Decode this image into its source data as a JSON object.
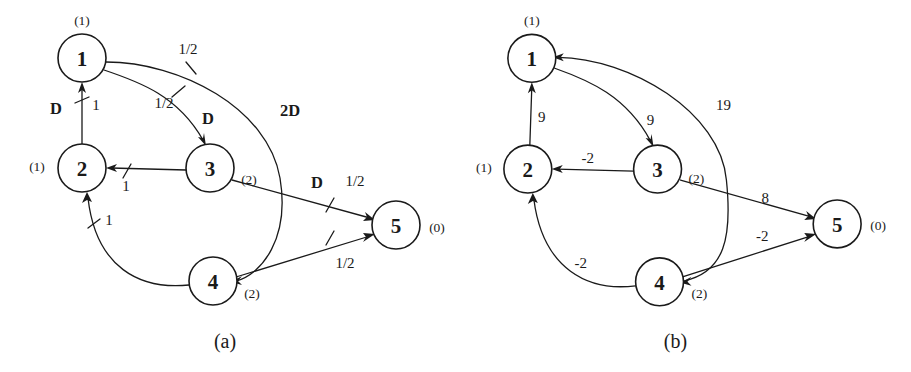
{
  "figure": {
    "background": "#ffffff",
    "ink": "#1a1a1a",
    "panels": [
      {
        "id": "a",
        "caption": "(a)",
        "nodes": [
          {
            "id": "1",
            "label": "1",
            "annotation": "(1)",
            "cx": 82,
            "cy": 58,
            "r": 24,
            "annot_x": 82,
            "annot_y": 20
          },
          {
            "id": "2",
            "label": "2",
            "annotation": "(1)",
            "cx": 82,
            "cy": 168,
            "r": 24,
            "annot_x": 37,
            "annot_y": 166
          },
          {
            "id": "3",
            "label": "3",
            "annotation": "(2)",
            "cx": 210,
            "cy": 168,
            "r": 24,
            "annot_x": 249,
            "annot_y": 179
          },
          {
            "id": "4",
            "label": "4",
            "annotation": "(2)",
            "cx": 213,
            "cy": 281,
            "r": 24,
            "annot_x": 252,
            "annot_y": 293
          },
          {
            "id": "5",
            "label": "5",
            "annotation": "(0)",
            "cx": 396,
            "cy": 225,
            "r": 24,
            "annot_x": 437,
            "annot_y": 227
          }
        ],
        "edges": [
          {
            "id": "e2-1",
            "from": "2",
            "to": "1",
            "labels": [
              "D",
              "1"
            ]
          },
          {
            "id": "e1-3",
            "from": "1",
            "to": "3",
            "labels": [
              "1/2",
              "D"
            ]
          },
          {
            "id": "e3-2",
            "from": "3",
            "to": "2",
            "labels": [
              "1"
            ]
          },
          {
            "id": "e1-4",
            "from": "1",
            "to": "4",
            "labels": [
              "1/2",
              "2D"
            ]
          },
          {
            "id": "e3-5",
            "from": "3",
            "to": "5",
            "labels": [
              "D",
              "1/2"
            ]
          },
          {
            "id": "e4-5",
            "from": "4",
            "to": "5",
            "labels": [
              "1/2"
            ]
          },
          {
            "id": "e4-2",
            "from": "4",
            "to": "2",
            "labels": [
              "1"
            ]
          }
        ],
        "edge_labels": [
          {
            "id": "a-lbl-D-21",
            "text": "D",
            "x": 56,
            "y": 108,
            "bold": true
          },
          {
            "id": "a-lbl-1-21",
            "text": "1",
            "x": 96,
            "y": 105,
            "bold": false
          },
          {
            "id": "a-lbl-half-13",
            "text": "1/2",
            "x": 164,
            "y": 103,
            "bold": false
          },
          {
            "id": "a-lbl-D-13",
            "text": "D",
            "x": 208,
            "y": 118,
            "bold": true
          },
          {
            "id": "a-lbl-half-14",
            "text": "1/2",
            "x": 188,
            "y": 49,
            "bold": false
          },
          {
            "id": "a-lbl-2D-14",
            "text": "2D",
            "x": 290,
            "y": 110,
            "bold": true
          },
          {
            "id": "a-lbl-1-32",
            "text": "1",
            "x": 126,
            "y": 186,
            "bold": false
          },
          {
            "id": "a-lbl-D-35",
            "text": "D",
            "x": 317,
            "y": 182,
            "bold": true
          },
          {
            "id": "a-lbl-half-35",
            "text": "1/2",
            "x": 355,
            "y": 181,
            "bold": false
          },
          {
            "id": "a-lbl-half-45",
            "text": "1/2",
            "x": 345,
            "y": 263,
            "bold": false
          },
          {
            "id": "a-lbl-1-42",
            "text": "1",
            "x": 109,
            "y": 220,
            "bold": false
          }
        ]
      },
      {
        "id": "b",
        "caption": "(b)",
        "nodes": [
          {
            "id": "1",
            "label": "1",
            "annotation": "(1)",
            "cx": 77,
            "cy": 58,
            "r": 24,
            "annot_x": 77,
            "annot_y": 20
          },
          {
            "id": "2",
            "label": "2",
            "annotation": "(1)",
            "cx": 73,
            "cy": 169,
            "r": 24,
            "annot_x": 29,
            "annot_y": 167
          },
          {
            "id": "3",
            "label": "3",
            "annotation": "(2)",
            "cx": 203,
            "cy": 169,
            "r": 24,
            "annot_x": 242,
            "annot_y": 178
          },
          {
            "id": "4",
            "label": "4",
            "annotation": "(2)",
            "cx": 205,
            "cy": 282,
            "r": 24,
            "annot_x": 245,
            "annot_y": 294
          },
          {
            "id": "5",
            "label": "5",
            "annotation": "(0)",
            "cx": 383,
            "cy": 224,
            "r": 24,
            "annot_x": 424,
            "annot_y": 226
          }
        ],
        "edges": [
          {
            "id": "e2-1",
            "from": "2",
            "to": "1",
            "labels": [
              "9"
            ]
          },
          {
            "id": "e1-3",
            "from": "1",
            "to": "3",
            "labels": [
              "9"
            ]
          },
          {
            "id": "e3-2",
            "from": "3",
            "to": "2",
            "labels": [
              "-2"
            ]
          },
          {
            "id": "e1-4",
            "from": "1",
            "to": "4",
            "labels": [
              "19"
            ]
          },
          {
            "id": "e3-5",
            "from": "3",
            "to": "5",
            "labels": [
              "8"
            ]
          },
          {
            "id": "e4-5",
            "from": "4",
            "to": "5",
            "labels": [
              "-2"
            ]
          },
          {
            "id": "e4-2",
            "from": "4",
            "to": "2",
            "labels": [
              "-2"
            ]
          }
        ],
        "edge_labels": [
          {
            "id": "b-lbl-9-21",
            "text": "9",
            "x": 87,
            "y": 117,
            "bold": false
          },
          {
            "id": "b-lbl-9-13",
            "text": "9",
            "x": 196,
            "y": 120,
            "bold": false
          },
          {
            "id": "b-lbl-19-14",
            "text": "19",
            "x": 269,
            "y": 105,
            "bold": false
          },
          {
            "id": "b-lbl-n2-32",
            "text": "-2",
            "x": 133,
            "y": 158,
            "bold": false
          },
          {
            "id": "b-lbl-8-35",
            "text": "8",
            "x": 311,
            "y": 198,
            "bold": false
          },
          {
            "id": "b-lbl-n2-45",
            "text": "-2",
            "x": 308,
            "y": 236,
            "bold": false
          },
          {
            "id": "b-lbl-n2-42",
            "text": "-2",
            "x": 126,
            "y": 263,
            "bold": false
          }
        ]
      }
    ],
    "captions": [
      {
        "id": "caption-a",
        "text": "(a)",
        "x": 225,
        "y": 341
      },
      {
        "id": "caption-b",
        "text": "(b)",
        "x": 221,
        "y": 341
      }
    ]
  }
}
